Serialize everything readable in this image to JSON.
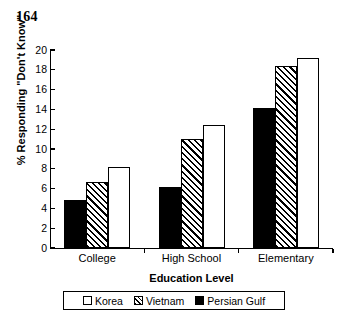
{
  "page_number": "164",
  "chart_data": {
    "type": "bar",
    "title": "",
    "xlabel": "Education Level",
    "ylabel": "% Responding \"Don't Know\"",
    "ylim": [
      0,
      20
    ],
    "ytick_step": 2,
    "yticks": [
      "20",
      "18",
      "16",
      "14",
      "12",
      "10",
      "8",
      "6",
      "4",
      "2",
      "0"
    ],
    "grid": false,
    "legend_position": "below-axis-boxed",
    "categories": [
      "College",
      "High School",
      "Elementary"
    ],
    "series": [
      {
        "name": "Persian Gulf",
        "style": "solid-black",
        "values": [
          4.8,
          6.2,
          14.1
        ]
      },
      {
        "name": "Vietnam",
        "style": "diagonal-hatch",
        "values": [
          6.7,
          11.0,
          18.4
        ]
      },
      {
        "name": "Korea",
        "style": "open-white",
        "values": [
          8.2,
          12.4,
          19.2
        ]
      }
    ],
    "legend_entries": [
      {
        "label": "Korea",
        "style": "open-white"
      },
      {
        "label": "Vietnam",
        "style": "diagonal-hatch"
      },
      {
        "label": "Persian Gulf",
        "style": "solid-black"
      }
    ],
    "colors": {
      "axis": "#000000",
      "solid": "#000000",
      "open": "#ffffff",
      "background": "#ffffff"
    }
  }
}
